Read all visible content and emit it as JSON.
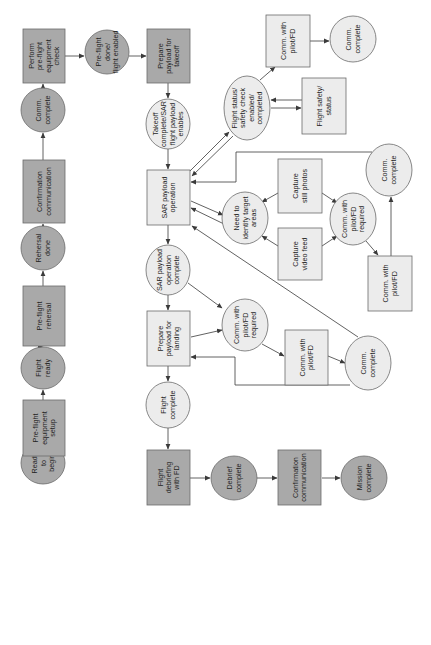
{
  "diagram": {
    "orientation": "rotated-90-ccw",
    "colors": {
      "dark_fill": "#a9a9a9",
      "light_fill": "#ececec",
      "stroke": "#6b6b6b",
      "edge": "#3a3a3a",
      "text": "#1e1e1e"
    },
    "nodes": [
      {
        "id": "ready",
        "shape": "ellipse",
        "style": "dark",
        "cx": 43,
        "cy": 463,
        "rx": 22,
        "ry": 21,
        "lines": [
          "Ready",
          "to",
          "begin"
        ]
      },
      {
        "id": "equip-setup",
        "shape": "rect",
        "style": "dark",
        "x": 23,
        "y": 400,
        "w": 42,
        "h": 56,
        "lines": [
          "Pre-flight",
          "equipment",
          "setup"
        ]
      },
      {
        "id": "flight-ready",
        "shape": "ellipse",
        "style": "dark",
        "cx": 43,
        "cy": 368,
        "rx": 22,
        "ry": 21,
        "lines": [
          "Flight",
          "ready"
        ]
      },
      {
        "id": "rehersal",
        "shape": "rect",
        "style": "dark",
        "x": 23,
        "y": 286,
        "w": 42,
        "h": 60,
        "lines": [
          "Pre-flight",
          "rehersal"
        ]
      },
      {
        "id": "rehersal-done",
        "shape": "ellipse",
        "style": "dark",
        "cx": 43,
        "cy": 248,
        "rx": 22,
        "ry": 22,
        "lines": [
          "Rehersal",
          "done"
        ]
      },
      {
        "id": "confirm-comm-1",
        "shape": "rect",
        "style": "dark",
        "x": 23,
        "y": 160,
        "w": 42,
        "h": 63,
        "lines": [
          "Confirmation",
          "communication"
        ]
      },
      {
        "id": "comm-complete-1",
        "shape": "ellipse",
        "style": "dark",
        "cx": 43,
        "cy": 110,
        "rx": 22,
        "ry": 22,
        "lines": [
          "Comm.",
          "complete"
        ]
      },
      {
        "id": "perform-check",
        "shape": "rect",
        "style": "dark",
        "x": 23,
        "y": 29,
        "w": 42,
        "h": 54,
        "lines": [
          "Perform",
          "pre-flight",
          "equipment",
          "check"
        ]
      },
      {
        "id": "preflight-done",
        "shape": "ellipse",
        "style": "dark",
        "cx": 107,
        "cy": 52,
        "rx": 22,
        "ry": 22,
        "lines": [
          "Pre-flight",
          "done/",
          "flight enabled"
        ]
      },
      {
        "id": "prepare-takeoff",
        "shape": "rect",
        "style": "dark",
        "x": 147,
        "y": 29,
        "w": 43,
        "h": 54,
        "lines": [
          "Prepare",
          "payload for",
          "takeoff"
        ]
      },
      {
        "id": "takeoff-complete",
        "shape": "ellipse",
        "style": "light",
        "cx": 168,
        "cy": 124,
        "rx": 22,
        "ry": 25,
        "lines": [
          "Takeoff",
          "complete/SAR",
          "flight payload",
          "enables"
        ]
      },
      {
        "id": "sar-operation",
        "shape": "rect",
        "style": "light",
        "x": 147,
        "y": 170,
        "w": 43,
        "h": 55,
        "lines": [
          "SAR payload",
          "operation"
        ]
      },
      {
        "id": "sar-op-complete",
        "shape": "ellipse",
        "style": "light",
        "cx": 168,
        "cy": 270,
        "rx": 22,
        "ry": 25,
        "lines": [
          "SAR payload",
          "operation",
          "complete"
        ]
      },
      {
        "id": "prepare-landing",
        "shape": "rect",
        "style": "light",
        "x": 147,
        "y": 311,
        "w": 43,
        "h": 55,
        "lines": [
          "Prepare",
          "payload for",
          "landing"
        ]
      },
      {
        "id": "flight-complete",
        "shape": "ellipse",
        "style": "light",
        "cx": 168,
        "cy": 405,
        "rx": 22,
        "ry": 23,
        "lines": [
          "Flight",
          "complete"
        ]
      },
      {
        "id": "debriefing",
        "shape": "rect",
        "style": "dark",
        "x": 147,
        "y": 450,
        "w": 43,
        "h": 55,
        "lines": [
          "Flight",
          "debriefing",
          "with FD"
        ]
      },
      {
        "id": "debrief-complete",
        "shape": "ellipse",
        "style": "dark",
        "cx": 234,
        "cy": 478,
        "rx": 23,
        "ry": 22,
        "lines": [
          "Debrief",
          "complete"
        ]
      },
      {
        "id": "confirm-comm-2",
        "shape": "rect",
        "style": "dark",
        "x": 278,
        "y": 450,
        "w": 43,
        "h": 55,
        "lines": [
          "Confirmation",
          "communication"
        ]
      },
      {
        "id": "mission-complete",
        "shape": "ellipse",
        "style": "dark",
        "cx": 364,
        "cy": 478,
        "rx": 23,
        "ry": 22,
        "lines": [
          "Mission",
          "complete"
        ]
      },
      {
        "id": "flight-status-check",
        "shape": "ellipse",
        "style": "light",
        "cx": 247,
        "cy": 108,
        "rx": 23,
        "ry": 32,
        "lines": [
          "Flight status/",
          "safety check",
          "enabled/",
          "completed"
        ]
      },
      {
        "id": "comm-pilot-top",
        "shape": "rect",
        "style": "light",
        "x": 266,
        "y": 15,
        "w": 44,
        "h": 52,
        "lines": [
          "Comm. with",
          "pilot/FD"
        ]
      },
      {
        "id": "comm-complete-top",
        "shape": "ellipse",
        "style": "light",
        "cx": 353,
        "cy": 39,
        "rx": 23,
        "ry": 23,
        "lines": [
          "Comm.",
          "complete"
        ]
      },
      {
        "id": "flight-safety-status",
        "shape": "rect",
        "style": "light",
        "x": 302,
        "y": 78,
        "w": 44,
        "h": 56,
        "lines": [
          "Flight safety/",
          "status"
        ]
      },
      {
        "id": "identify-targets",
        "shape": "ellipse",
        "style": "light",
        "cx": 245,
        "cy": 218,
        "rx": 23,
        "ry": 26,
        "lines": [
          "Need to",
          "identify target",
          "areas"
        ]
      },
      {
        "id": "capture-photos",
        "shape": "rect",
        "style": "light",
        "x": 278,
        "y": 159,
        "w": 44,
        "h": 54,
        "lines": [
          "Capture",
          "still photos"
        ]
      },
      {
        "id": "capture-video",
        "shape": "rect",
        "style": "light",
        "x": 278,
        "y": 228,
        "w": 44,
        "h": 52,
        "lines": [
          "Capture",
          "video feed"
        ]
      },
      {
        "id": "comm-pilot-req-mid",
        "shape": "ellipse",
        "style": "light",
        "cx": 353,
        "cy": 219,
        "rx": 23,
        "ry": 26,
        "lines": [
          "Comm. with",
          "pilot/FD",
          "required"
        ]
      },
      {
        "id": "comm-complete-mid",
        "shape": "ellipse",
        "style": "light",
        "cx": 389,
        "cy": 170,
        "rx": 23,
        "ry": 26,
        "lines": [
          "Comm.",
          "complete"
        ]
      },
      {
        "id": "comm-pilot-mid",
        "shape": "rect",
        "style": "light",
        "x": 368,
        "y": 256,
        "w": 44,
        "h": 55,
        "lines": [
          "Comm. with",
          "pilot/FD"
        ]
      },
      {
        "id": "comm-pilot-req-low",
        "shape": "ellipse",
        "style": "light",
        "cx": 245,
        "cy": 325,
        "rx": 23,
        "ry": 26,
        "lines": [
          "Comm. with",
          "pilot/FD",
          "required"
        ]
      },
      {
        "id": "comm-pilot-low",
        "shape": "rect",
        "style": "light",
        "x": 285,
        "y": 330,
        "w": 43,
        "h": 55,
        "lines": [
          "Comm. with",
          "pilot/FD"
        ]
      },
      {
        "id": "comm-complete-low",
        "shape": "ellipse",
        "style": "light",
        "cx": 368,
        "cy": 363,
        "rx": 23,
        "ry": 27,
        "lines": [
          "Comm.",
          "complete"
        ]
      }
    ],
    "edges": [
      {
        "from": "ready",
        "to": "equip-setup",
        "d": "M43 442 L43 457"
      },
      {
        "from": "equip-setup",
        "to": "flight-ready",
        "d": "M43 400 L43 390"
      },
      {
        "from": "flight-ready",
        "to": "rehersal",
        "d": "M43 347 L43 347"
      },
      {
        "from": "rehersal",
        "to": "rehersal-done",
        "d": "M43 286 L43 271"
      },
      {
        "from": "rehersal-done",
        "to": "confirm-comm-1",
        "d": "M43 226 L43 224"
      },
      {
        "from": "confirm-comm-1",
        "to": "comm-complete-1",
        "d": "M43 160 L43 133"
      },
      {
        "from": "comm-complete-1",
        "to": "perform-check",
        "d": "M43 88 L43 84"
      },
      {
        "from": "perform-check",
        "to": "preflight-done",
        "d": "M65 56 L84 56"
      },
      {
        "from": "preflight-done",
        "to": "prepare-takeoff",
        "d": "M129 56 L146 56"
      },
      {
        "from": "prepare-takeoff",
        "to": "takeoff-complete",
        "d": "M168 83 L168 98"
      },
      {
        "from": "takeoff-complete",
        "to": "sar-operation",
        "d": "M168 149 L168 169"
      },
      {
        "from": "sar-operation",
        "to": "sar-op-complete",
        "d": "M168 225 L168 244"
      },
      {
        "from": "sar-op-complete",
        "to": "prepare-landing",
        "d": "M168 295 L168 310"
      },
      {
        "from": "prepare-landing",
        "to": "flight-complete",
        "d": "M168 366 L168 381"
      },
      {
        "from": "flight-complete",
        "to": "debriefing",
        "d": "M168 428 L168 449"
      },
      {
        "from": "debriefing",
        "to": "debrief-complete",
        "d": "M190 478 L210 478"
      },
      {
        "from": "debrief-complete",
        "to": "confirm-comm-2",
        "d": "M257 478 L277 478"
      },
      {
        "from": "confirm-comm-2",
        "to": "mission-complete",
        "d": "M322 478 L340 478"
      },
      {
        "from": "sar-operation",
        "to": "flight-status-check",
        "d": "M189 172 L229 132"
      },
      {
        "from": "flight-status-check",
        "to": "sar-operation",
        "d": "M233 136 L192 176"
      },
      {
        "from": "flight-status-check",
        "to": "comm-pilot-top",
        "d": "M260 80 L275 67"
      },
      {
        "from": "comm-pilot-top",
        "to": "comm-complete-top",
        "d": "M310 41 L329 41"
      },
      {
        "from": "flight-safety-status",
        "to": "flight-status-check",
        "d": "M302 100 L271 100"
      },
      {
        "from": "flight-status-check",
        "to": "flight-safety-status",
        "d": "M271 108 L301 108"
      },
      {
        "from": "comm-complete-mid",
        "to": "sar-operation",
        "d": "M372 152 L236 152 L236 182 L191 182"
      },
      {
        "from": "sar-operation",
        "to": "identify-targets",
        "d": "M191 201 L223 215"
      },
      {
        "from": "identify-targets",
        "to": "sar-operation",
        "d": "M224 224 L191 208"
      },
      {
        "from": "capture-photos",
        "to": "identify-targets",
        "d": "M278 193 L262 202"
      },
      {
        "from": "capture-video",
        "to": "identify-targets",
        "d": "M278 246 L262 236"
      },
      {
        "from": "capture-photos",
        "to": "comm-pilot-req-mid",
        "d": "M322 193 L337 203"
      },
      {
        "from": "capture-video",
        "to": "comm-pilot-req-mid",
        "d": "M322 246 L337 236"
      },
      {
        "from": "comm-pilot-req-mid",
        "to": "comm-pilot-mid",
        "d": "M366 241 L378 255"
      },
      {
        "from": "comm-pilot-mid",
        "to": "comm-complete-mid",
        "d": "M391 256 L391 197"
      },
      {
        "from": "comm-complete-low",
        "to": "sar-operation",
        "d": "M358 337 L192 226"
      },
      {
        "from": "sar-op-complete",
        "to": "comm-pilot-req-low",
        "d": "M188 283 L222 308"
      },
      {
        "from": "prepare-landing",
        "to": "comm-pilot-req-low",
        "d": "M191 337 L222 330"
      },
      {
        "from": "comm-pilot-req-low",
        "to": "comm-pilot-low",
        "d": "M262 344 L284 356"
      },
      {
        "from": "comm-pilot-low",
        "to": "comm-complete-low",
        "d": "M328 356 L345 363"
      },
      {
        "from": "comm-complete-low",
        "to": "prepare-landing",
        "d": "M350 385 L235 385 L235 357 L191 357"
      }
    ]
  }
}
